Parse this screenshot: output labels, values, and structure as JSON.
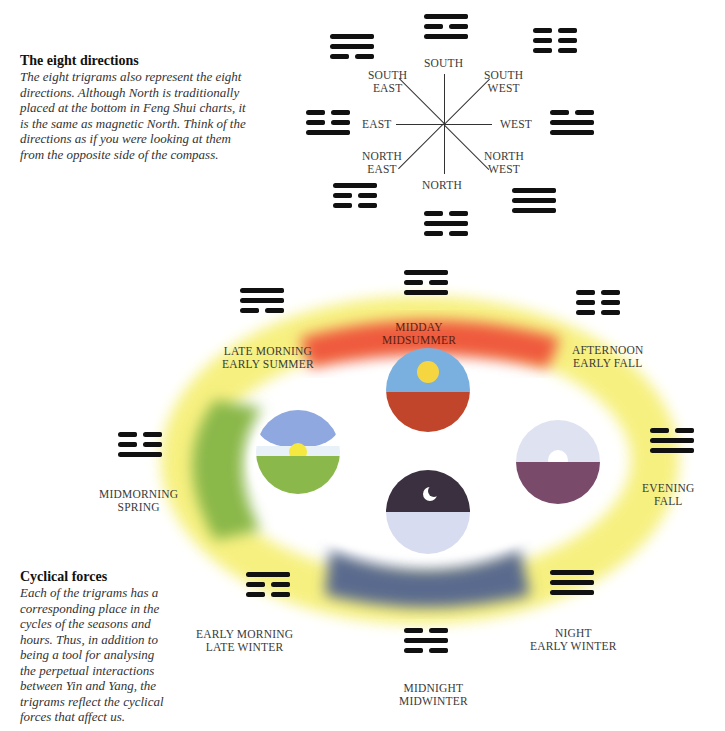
{
  "directions_section": {
    "heading": "The eight directions",
    "body": [
      "The eight trigrams also represent the eight",
      "directions. Although North is traditionally",
      "placed at the bottom in Feng Shui charts, it",
      "is the same as magnetic North. Think of the",
      "directions as if you were looking at them",
      "from the opposite side of the compass."
    ]
  },
  "compass": {
    "labels": {
      "south": "SOUTH",
      "south_east_1": "SOUTH",
      "south_east_2": "EAST",
      "south_west_1": "SOUTH",
      "south_west_2": "WEST",
      "east": "EAST",
      "west": "WEST",
      "north_east_1": "NORTH",
      "north_east_2": "EAST",
      "north_west_1": "NORTH",
      "north_west_2": "WEST",
      "north": "NORTH"
    },
    "trigrams": {
      "south": [
        "solid",
        "broken",
        "solid"
      ],
      "south_east": [
        "solid",
        "solid",
        "broken"
      ],
      "south_west": [
        "broken",
        "broken",
        "broken"
      ],
      "east": [
        "broken",
        "broken",
        "solid"
      ],
      "west": [
        "broken",
        "solid",
        "solid"
      ],
      "north_east": [
        "solid",
        "broken",
        "broken"
      ],
      "north_west": [
        "solid",
        "solid",
        "solid"
      ],
      "north": [
        "broken",
        "solid",
        "broken"
      ]
    }
  },
  "cycle": {
    "labels": {
      "midday_1": "MIDDAY",
      "midday_2": "MIDSUMMER",
      "late_morning_1": "LATE MORNING",
      "late_morning_2": "EARLY SUMMER",
      "afternoon_1": "AFTERNOON",
      "afternoon_2": "EARLY FALL",
      "midmorning_1": "MIDMORNING",
      "midmorning_2": "SPRING",
      "evening_1": "EVENING",
      "evening_2": "FALL",
      "early_morning_1": "EARLY MORNING",
      "early_morning_2": "LATE WINTER",
      "night_1": "NIGHT",
      "night_2": "EARLY WINTER",
      "midnight_1": "MIDNIGHT",
      "midnight_2": "MIDWINTER"
    },
    "colors": {
      "summer": "#ef5a3c",
      "spring": "#8ab84a",
      "winter": "#5a6a8e",
      "transition": "#f5ee6a",
      "sky": "#7ab0e0",
      "sun": "#f5d640",
      "earth_red": "#c0452a",
      "night_sky": "#3a3040",
      "dusk_purple": "#7a4a6a"
    }
  },
  "cyclical_section": {
    "heading": "Cyclical forces",
    "body": [
      "Each of the trigrams has a",
      "corresponding place in the",
      "cycles of the seasons and",
      "hours. Thus, in addition to",
      "being a tool for analysing",
      "the perpetual interactions",
      "between Yin and Yang, the",
      "trigrams reflect the cyclical",
      "forces that affect us."
    ]
  }
}
